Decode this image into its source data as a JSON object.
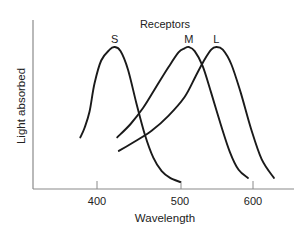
{
  "chart_data": {
    "type": "line",
    "title": "Receptors",
    "xlabel": "Wavelength",
    "ylabel": "Light absorbed",
    "x_ticks": [
      400,
      500,
      600
    ],
    "x_tick_labels": [
      "400",
      "500",
      "600"
    ],
    "xlim": [
      330,
      650
    ],
    "ylim": [
      0,
      1
    ],
    "grid": false,
    "legend": "none (curves labeled at peaks)",
    "series": [
      {
        "name": "S",
        "peak_wavelength": 421,
        "x": [
          333,
          350,
          370,
          390,
          405,
          415,
          421,
          428,
          437,
          447,
          457,
          467,
          477,
          487,
          499
        ],
        "y": [
          0.33,
          0.4,
          0.52,
          0.73,
          0.9,
          0.98,
          1.0,
          0.97,
          0.83,
          0.58,
          0.35,
          0.18,
          0.08,
          0.03,
          0.0
        ]
      },
      {
        "name": "M",
        "peak_wavelength": 511,
        "x": [
          424,
          440,
          455,
          470,
          485,
          497,
          505,
          511,
          519,
          530,
          542,
          555,
          568,
          580,
          593
        ],
        "y": [
          0.33,
          0.43,
          0.55,
          0.7,
          0.85,
          0.96,
          0.99,
          1.0,
          0.97,
          0.86,
          0.66,
          0.43,
          0.22,
          0.09,
          0.03
        ]
      },
      {
        "name": "L",
        "peak_wavelength": 549,
        "x": [
          426,
          445,
          465,
          485,
          505,
          520,
          532,
          542,
          549,
          558,
          570,
          583,
          597,
          612,
          629
        ],
        "y": [
          0.23,
          0.3,
          0.38,
          0.49,
          0.63,
          0.78,
          0.9,
          0.98,
          1.0,
          0.98,
          0.87,
          0.66,
          0.4,
          0.17,
          0.03
        ]
      }
    ],
    "annotations": [
      "S",
      "M",
      "L"
    ]
  },
  "labels": {
    "title": "Receptors",
    "xlabel": "Wavelength",
    "ylabel": "Light absorbed",
    "ticks": [
      "400",
      "500",
      "600"
    ],
    "series_labels": [
      "S",
      "M",
      "L"
    ]
  }
}
